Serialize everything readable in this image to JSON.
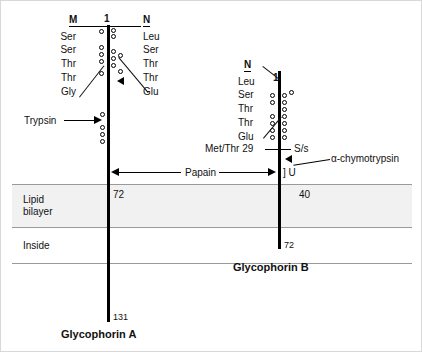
{
  "figure": {
    "membrane": {
      "lipid_bilayer_label": "Lipid\nbilayer",
      "lipid_label_line1": "Lipid",
      "lipid_label_line2": "bilayer",
      "inside_label": "Inside"
    },
    "glycophorin_a": {
      "title": "Glycophorin A",
      "n_terminus_position": "1",
      "antigen_m": {
        "label": "M",
        "residues": [
          "Ser",
          "Ser",
          "Thr",
          "Thr",
          "Gly"
        ]
      },
      "antigen_n": {
        "label": "N",
        "residues": [
          "Leu",
          "Ser",
          "Thr",
          "Thr",
          "Glu"
        ]
      },
      "membrane_entry_residue": "72",
      "c_terminus_residue": "131"
    },
    "glycophorin_b": {
      "title": "Glycophorin B",
      "n_terminus_position": "1",
      "antigen_n": {
        "label": "N",
        "residues": [
          "Leu",
          "Ser",
          "Thr",
          "Thr",
          "Glu"
        ]
      },
      "polymorphism": "Met/Thr 29",
      "antigen_ss": "S/s",
      "antigen_u": "] U",
      "membrane_entry_residue": "40",
      "c_terminus_residue": "72"
    },
    "proteases": {
      "trypsin": "Trypsin",
      "papain": "Papain",
      "chymotrypsin": "α-chymotrypsin"
    },
    "colors": {
      "chain": "#000000",
      "bilayer_fill": "#f1f1f1",
      "rule": "#9a9a9a",
      "text": "#111111"
    }
  }
}
